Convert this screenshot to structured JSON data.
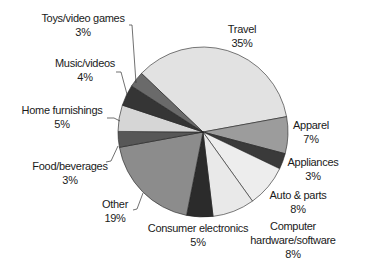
{
  "chart_data": {
    "type": "pie",
    "title": "",
    "start_angle_deg": -46.4,
    "direction": "clockwise",
    "center": [
      203,
      132
    ],
    "radius": 85,
    "slices": [
      {
        "label": "Travel",
        "value": 35,
        "pct_label": "35%",
        "color": "#e2e2e2",
        "label_lines": [
          "Travel"
        ],
        "label_pos": [
          242,
          22
        ],
        "leader": null
      },
      {
        "label": "Apparel",
        "value": 7,
        "pct_label": "7%",
        "color": "#9c9c9c",
        "label_lines": [
          "Apparel"
        ],
        "label_pos": [
          311,
          118
        ],
        "leader": null
      },
      {
        "label": "Appliances",
        "value": 3,
        "pct_label": "3%",
        "color": "#3a3a3a",
        "label_lines": [
          "Appliances"
        ],
        "label_pos": [
          313,
          155
        ],
        "leader": null
      },
      {
        "label": "Auto & parts",
        "value": 8,
        "pct_label": "8%",
        "color": "#ededed",
        "label_lines": [
          "Auto & parts"
        ],
        "label_pos": [
          298,
          188
        ],
        "leader": null
      },
      {
        "label": "Computer hardware/software",
        "value": 8,
        "pct_label": "8%",
        "color": "#e9e9e9",
        "label_lines": [
          "Computer",
          "hardware/software"
        ],
        "label_pos": [
          293,
          219
        ],
        "leader": null
      },
      {
        "label": "Consumer electronics",
        "value": 5,
        "pct_label": "5%",
        "color": "#2b2b2b",
        "label_lines": [
          "Consumer electronics"
        ],
        "label_pos": [
          198,
          221
        ],
        "leader": null
      },
      {
        "label": "Other",
        "value": 19,
        "pct_label": "19%",
        "color": "#8c8c8c",
        "label_lines": [
          "Other"
        ],
        "label_pos": [
          115,
          197
        ],
        "leader": [
          [
            133,
            210
          ],
          [
            137,
            209
          ],
          [
            143,
            193
          ]
        ]
      },
      {
        "label": "Food/beverages",
        "value": 3,
        "pct_label": "3%",
        "color": "#575757",
        "label_lines": [
          "Food/beverages"
        ],
        "label_pos": [
          70,
          159
        ],
        "leader": [
          [
            106,
            162
          ],
          [
            111,
            161
          ],
          [
            118,
            146
          ]
        ]
      },
      {
        "label": "Home furnishings",
        "value": 5,
        "pct_label": "5%",
        "color": "#d6d6d6",
        "label_lines": [
          "Home furnishings"
        ],
        "label_pos": [
          62,
          103
        ],
        "leader": [
          [
            107,
            118
          ],
          [
            114,
            118
          ],
          [
            120,
            121
          ]
        ]
      },
      {
        "label": "Music/videos",
        "value": 4,
        "pct_label": "4%",
        "color": "#353535",
        "label_lines": [
          "Music/videos"
        ],
        "label_pos": [
          85,
          56
        ],
        "leader": [
          [
            116,
            72
          ],
          [
            121,
            72
          ],
          [
            128,
            98
          ]
        ]
      },
      {
        "label": "Toys/video games",
        "value": 3,
        "pct_label": "3%",
        "color": "#6a6a6a",
        "label_lines": [
          "Toys/video games"
        ],
        "label_pos": [
          83,
          11
        ],
        "leader": [
          [
            129,
            25
          ],
          [
            132,
            25
          ],
          [
            136,
            83
          ]
        ]
      }
    ],
    "legend": null,
    "stroke_color": "#222222"
  }
}
